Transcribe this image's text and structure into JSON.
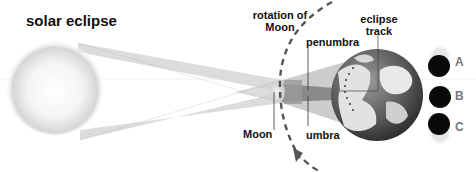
{
  "title": "solar eclipse",
  "labels": {
    "rotation": "rotation of",
    "rotation2": "Moon",
    "penumbra": "penumbra",
    "eclipse_track": "eclipse",
    "eclipse_track2": "track",
    "moon": "Moon",
    "umbra": "umbra"
  },
  "phases": [
    {
      "label": "A"
    },
    {
      "label": "B"
    },
    {
      "label": "C"
    }
  ],
  "colors": {
    "beam": "#d8d8d8",
    "umbra": "#8a8a8a",
    "penumbra": "#bdbdbd",
    "earth_dark": "#3a3a3a",
    "earth_light": "#e6e6e6",
    "dash": "#555555"
  }
}
